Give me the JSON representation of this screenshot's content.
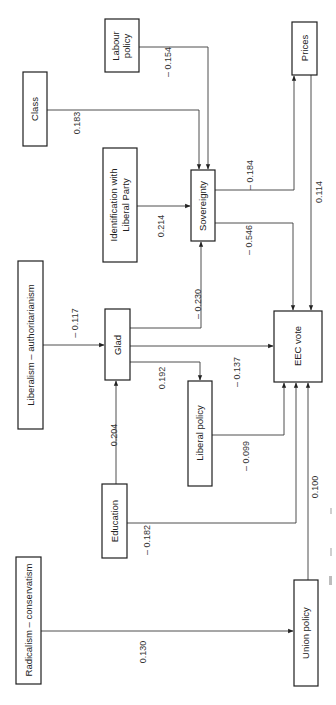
{
  "diagram": {
    "type": "path-diagram",
    "orientation": "rotated-90-ccw",
    "colors": {
      "line": "#3a3a3a",
      "box_border": "#1e1e1e",
      "text": "#222222",
      "background": "#ffffff"
    },
    "nodes": {
      "labour_policy": {
        "lines": [
          "Labour",
          "policy"
        ]
      },
      "class": {
        "lines": [
          "Class"
        ]
      },
      "identification": {
        "lines": [
          "Identification with",
          "Liberal Party"
        ]
      },
      "sovereignty": {
        "lines": [
          "Sovereignty"
        ]
      },
      "prices": {
        "lines": [
          "Prices"
        ]
      },
      "lib_auth": {
        "lines": [
          "Liberalism – authoritarianism"
        ]
      },
      "glad": {
        "lines": [
          "Glad"
        ]
      },
      "liberal_policy": {
        "lines": [
          "Liberal policy"
        ]
      },
      "eec_vote": {
        "lines": [
          "EEC vote"
        ]
      },
      "education": {
        "lines": [
          "Education"
        ]
      },
      "rad_cons": {
        "lines": [
          "Radicalism – conservatism"
        ]
      },
      "union_policy": {
        "lines": [
          "Union policy"
        ]
      }
    },
    "edges": [
      {
        "id": "labour_sov",
        "from": "Labour policy",
        "to": "Sovereignty",
        "coef": "– 0.154"
      },
      {
        "id": "class_sov",
        "from": "Class",
        "to": "Sovereignty",
        "coef": "0.183"
      },
      {
        "id": "ident_sov",
        "from": "Identification with Liberal Party",
        "to": "Sovereignty",
        "coef": "0.214"
      },
      {
        "id": "sov_prices",
        "from": "Sovereignty",
        "to": "Prices",
        "coef": "– 0.184"
      },
      {
        "id": "sov_eec",
        "from": "Sovereignty",
        "to": "EEC vote",
        "coef": "– 0.546"
      },
      {
        "id": "prices_eec",
        "from": "Prices",
        "to": "EEC vote",
        "coef": "0.114"
      },
      {
        "id": "libauth_glad",
        "from": "Liberalism – authoritarianism",
        "to": "Glad",
        "coef": "– 0.117"
      },
      {
        "id": "glad_sov",
        "from": "Glad",
        "to": "Sovereignty",
        "coef": "– 0.230"
      },
      {
        "id": "glad_eec",
        "from": "Glad",
        "to": "EEC vote",
        "coef": "– 0.137"
      },
      {
        "id": "glad_libpol",
        "from": "Glad",
        "to": "Liberal policy",
        "coef": "0.192"
      },
      {
        "id": "edu_glad",
        "from": "Education",
        "to": "Glad",
        "coef": "0.204"
      },
      {
        "id": "libpol_eec",
        "from": "Liberal policy",
        "to": "EEC vote",
        "coef": "– 0.099"
      },
      {
        "id": "edu_eec",
        "from": "Education",
        "to": "EEC vote",
        "coef": "– 0.182"
      },
      {
        "id": "union_eec",
        "from": "Union policy",
        "to": "EEC vote",
        "coef": "0.100"
      },
      {
        "id": "radcons_union",
        "from": "Radicalism – conservatism",
        "to": "Union policy",
        "coef": "0.130"
      }
    ]
  }
}
